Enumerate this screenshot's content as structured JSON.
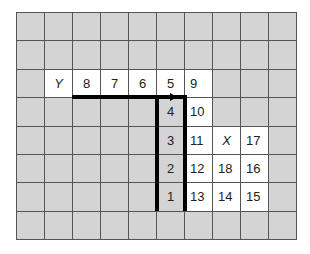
{
  "grid": {
    "cols": 10,
    "rows": 8,
    "colors": {
      "gray": "#d4d4d4",
      "white": "#ffffff",
      "line": "#555555",
      "path": "#000000"
    },
    "cells": [
      {
        "row": 2,
        "col": 1,
        "label": "Y",
        "white": true,
        "italic": true,
        "center": true
      },
      {
        "row": 2,
        "col": 2,
        "label": "8",
        "white": true,
        "center": true
      },
      {
        "row": 2,
        "col": 3,
        "label": "7",
        "white": true,
        "center": true
      },
      {
        "row": 2,
        "col": 4,
        "label": "6",
        "white": true,
        "center": true
      },
      {
        "row": 2,
        "col": 5,
        "label": "5",
        "white": true,
        "center": true
      },
      {
        "row": 2,
        "col": 6,
        "label": "9",
        "white": true
      },
      {
        "row": 3,
        "col": 5,
        "label": "4",
        "white": false,
        "center": true
      },
      {
        "row": 3,
        "col": 6,
        "label": "10",
        "white": true
      },
      {
        "row": 4,
        "col": 5,
        "label": "3",
        "white": false,
        "center": true
      },
      {
        "row": 4,
        "col": 6,
        "label": "11",
        "white": true
      },
      {
        "row": 4,
        "col": 7,
        "label": "X",
        "white": true,
        "italic": true,
        "center": true
      },
      {
        "row": 4,
        "col": 8,
        "label": "17",
        "white": true
      },
      {
        "row": 5,
        "col": 5,
        "label": "2",
        "white": false,
        "center": true
      },
      {
        "row": 5,
        "col": 6,
        "label": "12",
        "white": true
      },
      {
        "row": 5,
        "col": 7,
        "label": "18",
        "white": true
      },
      {
        "row": 5,
        "col": 8,
        "label": "16",
        "white": true
      },
      {
        "row": 6,
        "col": 5,
        "label": "1",
        "white": false,
        "center": true
      },
      {
        "row": 6,
        "col": 6,
        "label": "13",
        "white": true
      },
      {
        "row": 6,
        "col": 7,
        "label": "14",
        "white": true
      },
      {
        "row": 6,
        "col": 8,
        "label": "15",
        "white": true
      }
    ]
  }
}
